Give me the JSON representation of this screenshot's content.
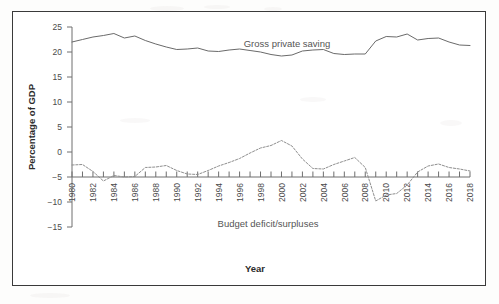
{
  "chart_data": {
    "type": "line",
    "title": "",
    "xlabel": "Year",
    "ylabel": "Percentage of GDP",
    "xlim": [
      1980,
      2018
    ],
    "ylim": [
      -15,
      25
    ],
    "ytick_values": [
      25,
      20,
      15,
      10,
      5,
      0,
      -5,
      -10,
      -15
    ],
    "ytick_labels": [
      "25",
      "20",
      "15",
      "10",
      "5",
      "0",
      "−5",
      "−10",
      "−15"
    ],
    "xtick_labels": [
      "1980",
      "1982",
      "1984",
      "1986",
      "1988",
      "1990",
      "1992",
      "1994",
      "1996",
      "1998",
      "2000",
      "2002",
      "2004",
      "2006",
      "2008",
      "2010",
      "2012",
      "2014",
      "2016",
      "2018"
    ],
    "xtick_values": [
      1980,
      1982,
      1984,
      1986,
      1988,
      1990,
      1992,
      1994,
      1996,
      1998,
      2000,
      2002,
      2004,
      2006,
      2008,
      2010,
      2012,
      2014,
      2016,
      2018
    ],
    "grid": false,
    "legend_position": "inline-annotation",
    "x": [
      1980,
      1981,
      1982,
      1983,
      1984,
      1985,
      1986,
      1987,
      1988,
      1989,
      1990,
      1991,
      1992,
      1993,
      1994,
      1995,
      1996,
      1997,
      1998,
      1999,
      2000,
      2001,
      2002,
      2003,
      2004,
      2005,
      2006,
      2007,
      2008,
      2009,
      2010,
      2011,
      2012,
      2013,
      2014,
      2015,
      2016,
      2017,
      2018
    ],
    "series": [
      {
        "name": "Gross private saving",
        "style": "solid",
        "label_text": "Gross private saving",
        "values": [
          22.0,
          22.5,
          23.0,
          23.3,
          23.7,
          22.8,
          23.2,
          22.3,
          21.6,
          21.0,
          20.5,
          20.6,
          20.8,
          20.2,
          20.1,
          20.4,
          20.6,
          20.3,
          20.0,
          19.5,
          19.2,
          19.4,
          20.2,
          20.4,
          20.5,
          19.7,
          19.5,
          19.6,
          19.6,
          22.2,
          23.1,
          23.0,
          23.6,
          22.4,
          22.7,
          22.8,
          22.0,
          21.4,
          21.3
        ]
      },
      {
        "name": "Budget deficit/surpluses",
        "style": "dotted",
        "label_text": "Budget  deficit/surpluses",
        "values": [
          -2.6,
          -2.5,
          -3.9,
          -5.8,
          -4.7,
          -5.0,
          -4.9,
          -3.1,
          -3.0,
          -2.7,
          -3.7,
          -4.4,
          -4.5,
          -3.7,
          -2.8,
          -2.1,
          -1.3,
          -0.2,
          0.8,
          1.3,
          2.3,
          1.2,
          -1.4,
          -3.3,
          -3.4,
          -2.5,
          -1.8,
          -1.1,
          -3.1,
          -9.8,
          -8.6,
          -8.3,
          -6.6,
          -4.0,
          -2.8,
          -2.4,
          -3.1,
          -3.4,
          -3.8
        ]
      }
    ],
    "annotations": [
      {
        "text": "Gross private saving",
        "x_pixel": 287,
        "y_pixel": 47
      },
      {
        "text": "Budget  deficit/surpluses",
        "x_pixel": 268,
        "y_pixel": 227
      }
    ]
  },
  "figure": {
    "y_axis_title": "Percentage of GDP",
    "x_axis_title": "Year"
  }
}
